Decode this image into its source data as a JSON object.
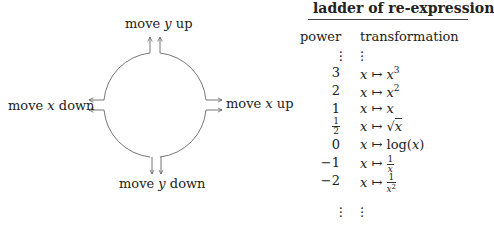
{
  "diagram": {
    "labels": {
      "y_up": {
        "pre": "move ",
        "var": "y",
        "post": " up"
      },
      "y_down": {
        "pre": "move ",
        "var": "y",
        "post": " down"
      },
      "x_up": {
        "pre": "move ",
        "var": "x",
        "post": " up"
      },
      "x_down": {
        "pre": "move ",
        "var": "x",
        "post": " down"
      }
    }
  },
  "ladder": {
    "title": "ladder of re-expression",
    "headers": {
      "power": "power",
      "transformation": "transformation"
    },
    "rows": [
      {
        "power": "⋮",
        "transformation": "⋮"
      },
      {
        "power": "3",
        "transformation": "x ↦ x^3"
      },
      {
        "power": "2",
        "transformation": "x ↦ x^2"
      },
      {
        "power": "1",
        "transformation": "x ↦ x"
      },
      {
        "power": "1/2",
        "transformation": "x ↦ √x"
      },
      {
        "power": "0",
        "transformation": "x ↦ log(x)"
      },
      {
        "power": "−1",
        "transformation": "x ↦ 1/x"
      },
      {
        "power": "−2",
        "transformation": "x ↦ 1/x^2"
      },
      {
        "power": "⋮",
        "transformation": "⋮"
      }
    ],
    "parts": {
      "x": "x",
      "mapsto": " ↦ ",
      "exp3": "3",
      "exp2": "2",
      "sqrt": "√",
      "log_open": "log(",
      "log_close": ")",
      "one": "1",
      "half_num": "1",
      "half_den": "2",
      "p3": "3",
      "p2": "2",
      "p1": "1",
      "p0": "0",
      "pm1": "−1",
      "pm2": "−2"
    }
  }
}
